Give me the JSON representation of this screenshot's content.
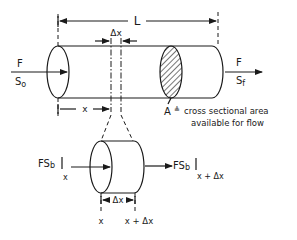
{
  "diagram": {
    "labels": {
      "length": "L",
      "delta_x_top": "Δx",
      "x_top": "x",
      "inlet_flow": "F",
      "inlet_conc": "S",
      "inlet_conc_sub": "o",
      "outlet_flow": "F",
      "outlet_conc": "S",
      "outlet_conc_sub": "f",
      "area_symbol": "A",
      "area_def_symbol": "≜",
      "area_desc_line1": "cross sectional area",
      "area_desc_line2": "available for flow",
      "flux_in": "FS",
      "flux_in_sub": "b",
      "flux_in_eval": "x",
      "flux_out": "FS",
      "flux_out_sub": "b",
      "flux_out_eval": "x + Δx",
      "delta_x_bottom": "Δx",
      "x_bottom": "x",
      "x_plus_dx_bottom": "x + Δx"
    }
  }
}
